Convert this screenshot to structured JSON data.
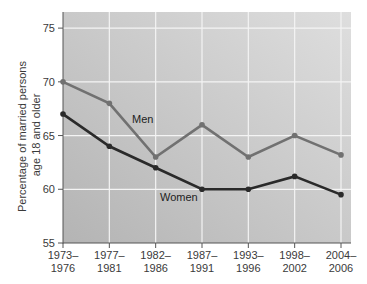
{
  "chart_data": {
    "type": "line",
    "title": "",
    "xlabel": "",
    "ylabel": "Percentage of married persons age 18 and older",
    "ylabel_lines": [
      "Percentage of married persons",
      "age 18 and older"
    ],
    "categories": [
      [
        "1973–",
        "1976"
      ],
      [
        "1977–",
        "1981"
      ],
      [
        "1982–",
        "1986"
      ],
      [
        "1987–",
        "1991"
      ],
      [
        "1993–",
        "1996"
      ],
      [
        "1998–",
        "2002"
      ],
      [
        "2004–",
        "2006"
      ]
    ],
    "category_labels": [
      "1973–1976",
      "1977–1981",
      "1982–1986",
      "1987–1991",
      "1993–1996",
      "1998–2002",
      "2004–2006"
    ],
    "series": [
      {
        "name": "Men",
        "color": "#717171",
        "values": [
          70,
          68,
          63,
          66,
          63,
          65,
          63.2
        ]
      },
      {
        "name": "Women",
        "color": "#2a2a2a",
        "values": [
          67,
          64,
          62,
          60,
          60,
          61.2,
          59.5
        ]
      }
    ],
    "ylim": [
      55,
      76.5
    ],
    "yticks": [
      55,
      60,
      65,
      70,
      75
    ],
    "grid": true,
    "legend": "inline labels",
    "annotations": [
      {
        "text": "Men",
        "near_category": "1982–1986"
      },
      {
        "text": "Women",
        "near_category": "1987–1991"
      }
    ],
    "colors": {
      "plot_bg_light": "#dedede",
      "plot_bg_dark": "#b4b4b4",
      "grid": "#f4f4f4",
      "axis": "#555555"
    }
  }
}
